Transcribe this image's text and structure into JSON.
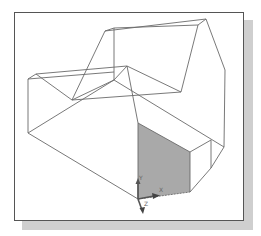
{
  "figure": {
    "colors": {
      "frame_border": "#555555",
      "shadow": "#cfcfcf",
      "wire": "#6a6a6a",
      "shaded_face": "#a9a9a9",
      "ucs_icon": "#555555"
    }
  },
  "ucs_icon": {
    "x_label": "X",
    "y_label": "Y",
    "z_label": "Z"
  }
}
